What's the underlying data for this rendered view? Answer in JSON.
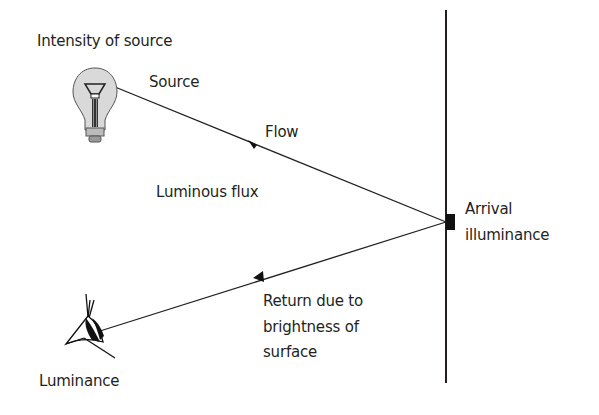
{
  "diagram": {
    "labels": {
      "intensity": "Intensity of source",
      "source": "Source",
      "flow": "Flow",
      "luminous_flux": "Luminous flux",
      "arrival_line1": "Arrival",
      "arrival_line2": "illuminance",
      "return_line1": "Return due to",
      "return_line2": "brightness of",
      "return_line3": "surface",
      "luminance": "Luminance"
    },
    "icons": {
      "source": "light-bulb-icon",
      "observer": "eye-icon"
    },
    "colors": {
      "line": "#231f20",
      "background": "#ffffff",
      "bulb_glass": "#d9d9d9"
    }
  }
}
